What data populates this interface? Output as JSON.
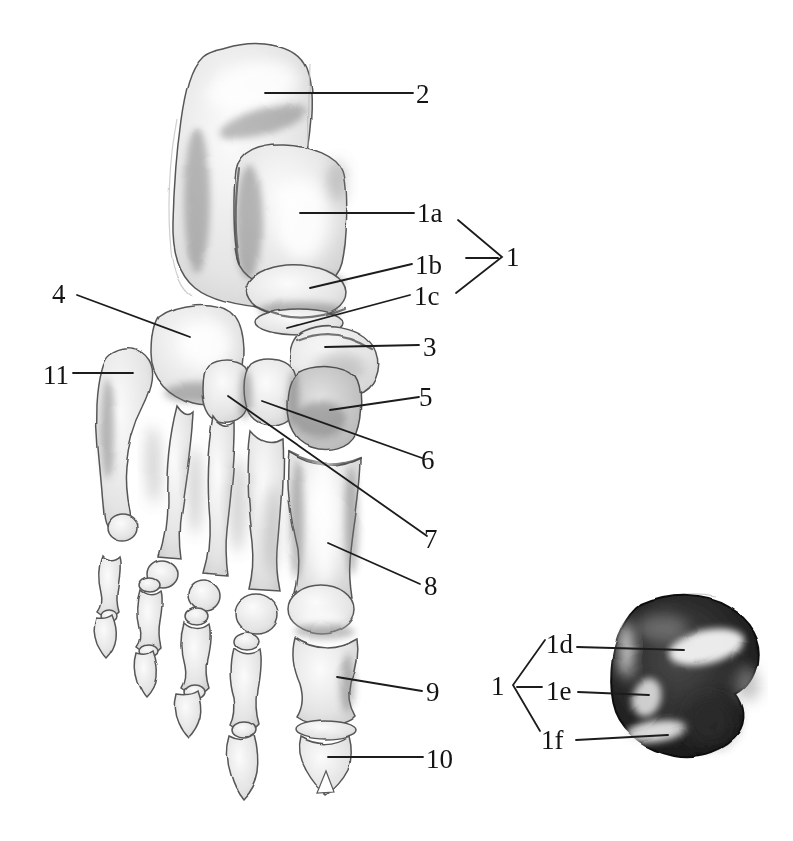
{
  "figure": {
    "colors": {
      "paper": "#ffffff",
      "ink": "#1c1c1c",
      "bone_light": "#f2f2f2",
      "bone_shade": "#bdbdbd",
      "detail_dark": "#1a1a1a"
    },
    "labels": {
      "n2": "2",
      "n1a": "1a",
      "n1b": "1b",
      "n1c": "1c",
      "n1_main": "1",
      "n3": "3",
      "n4": "4",
      "n5": "5",
      "n6": "6",
      "n7": "7",
      "n8": "8",
      "n9": "9",
      "n10": "10",
      "n11": "11",
      "n1_detail": "1",
      "n1d": "1d",
      "n1e": "1e",
      "n1f": "1f"
    }
  }
}
